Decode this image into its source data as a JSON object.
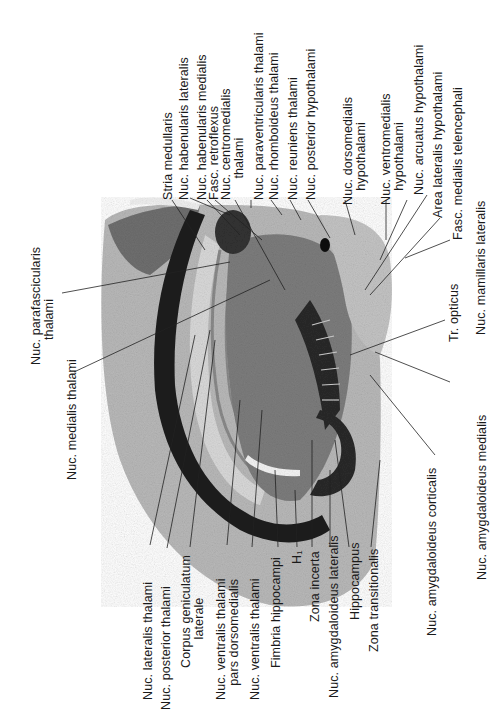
{
  "figure": {
    "type": "histological brain section, coronal (rotated 90°)",
    "labels_top": [
      {
        "id": "stria-medullaris",
        "text": "Stria medullaris"
      },
      {
        "id": "nuc-habenularis-lateralis",
        "text": "Nuc. habenularis lateralis"
      },
      {
        "id": "nuc-habenularis-medialis",
        "text": "Nuc. habenularis medialis"
      },
      {
        "id": "fasc-retroflexus",
        "text": "Fasc. retroflexus"
      },
      {
        "id": "nuc-centromedialis-thalami",
        "text": "Nuc. centromedialis\n      thalami"
      },
      {
        "id": "nuc-paraventricularis-thalami",
        "text": "Nuc. paraventricularis thalami"
      },
      {
        "id": "nuc-rhomboideus-thalami",
        "text": "Nuc. rhomboideus thalami"
      },
      {
        "id": "nuc-reuniens-thalami",
        "text": "Nuc. reuniens thalami"
      },
      {
        "id": "nuc-posterior-hypothalami",
        "text": "Nuc. posterior hypothalami"
      },
      {
        "id": "nuc-dorsomedialis-hypothalami",
        "text": "Nuc. dorsomedialis\n    hypothalami"
      },
      {
        "id": "nuc-ventromedialis-hypothalami",
        "text": "Nuc. ventromedialis\n    hypothalami"
      },
      {
        "id": "nuc-arcuatus-hypothalami",
        "text": "Nuc. arcuatus hypothalami"
      },
      {
        "id": "area-lateralis-hypothalami",
        "text": "Area lateralis hypothalami"
      },
      {
        "id": "fasc-medialis-telencephali",
        "text": "Fasc. medialis telencephali"
      },
      {
        "id": "nuc-mamillaris-lateralis",
        "text": "Nuc. mamillaris lateralis"
      }
    ],
    "labels_left": [
      {
        "id": "nuc-parafascicularis-thalami",
        "text": "Nuc. parafascicularis\n       thalami"
      },
      {
        "id": "nuc-medialis-thalami",
        "text": "Nuc. medialis thalami"
      }
    ],
    "labels_right": [
      {
        "id": "tr-opticus",
        "text": "Tr. opticus"
      },
      {
        "id": "nuc-amygdaloideus-medialis",
        "text": "Nuc. amygdaloideus medialis"
      },
      {
        "id": "nuc-amygdaloideus-corticalis",
        "text": "Nuc. amygdaloideus corticalis"
      }
    ],
    "labels_bottom": [
      {
        "id": "nuc-lateralis-thalami",
        "text": "Nuc. lateralis thalami"
      },
      {
        "id": "nuc-posterior-thalami",
        "text": "Nuc. posterior thalami"
      },
      {
        "id": "corpus-geniculatum-laterale",
        "text": "Corpus geniculatum\n        laterale"
      },
      {
        "id": "nuc-ventralis-thalami-pars-dorsomedialis",
        "text": "Nuc. ventralis thalami\n    pars dorsomedialis"
      },
      {
        "id": "nuc-ventralis-thalami",
        "text": "Nuc. ventralis thalami"
      },
      {
        "id": "fimbria-hippocampi",
        "text": "Fimbria hippocampi"
      },
      {
        "id": "h1",
        "text": "H₁"
      },
      {
        "id": "zona-incerta",
        "text": "Zona incerta"
      },
      {
        "id": "nuc-amygdaloideus-lateralis",
        "text": "Nuc. amygdaloideus lateralis"
      },
      {
        "id": "hippocampus",
        "text": "Hippocampus"
      },
      {
        "id": "zona-transitionalis",
        "text": "Zona transitionalis"
      }
    ]
  }
}
